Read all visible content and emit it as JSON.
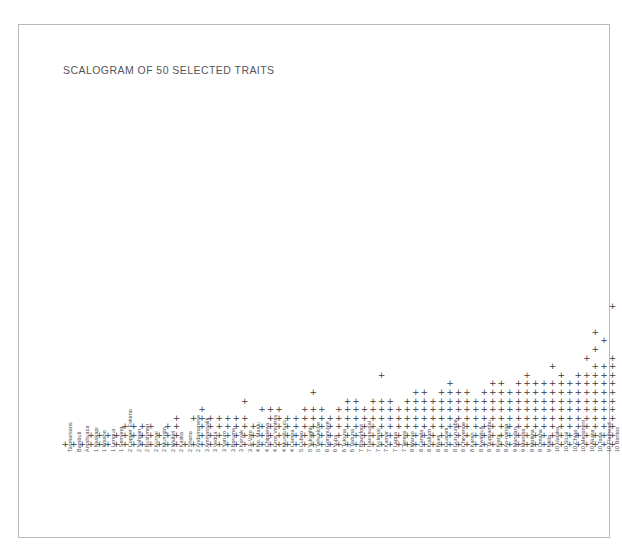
{
  "figure": {
    "title": "SCALOGRAM OF 50 SELECTED TRAITS",
    "mark_glyph": "+",
    "mark_color": "#3b3b3f",
    "frame_color": "#b9b9b9",
    "background": "#ffffff"
  },
  "chart_data": {
    "type": "scatter",
    "title": "SCALOGRAM OF 50 SELECTED TRAITS",
    "xlabel": "",
    "ylabel": "",
    "grid": false,
    "legend": "none",
    "marker": "+",
    "n_rows": 50,
    "n_columns": 89,
    "categories": [
      "Tasmanians",
      "Bambuti",
      "Amahuaca",
      "1 Naskapi",
      "1 Washo",
      "1 Lengua",
      "1 Semang",
      "2 Copper Eskimo",
      "2 Yahgan",
      "2 Bushmen",
      "2 Kurnai",
      "2 Murngin",
      "2 Walbiri",
      "2 Kaska",
      "2 Shona",
      "2 Andamanese",
      "3 Arunta-Ruwala",
      "3 Vedda",
      "3 Yaruro",
      "3 Boruma",
      "3 Koryak",
      "3 Ji-Vato",
      "4 No. Maidu",
      "4 Chippewa",
      "4 Gros Ventres",
      "4 Mundurucu",
      "4 Campa",
      "5 Cubeo",
      "5 Yukaghir",
      "5 Tehuelche",
      "6 Goranuine",
      "6 Yupa",
      "6 Tukuna",
      "6 Tiatuna",
      "7 Blackfoot",
      "7 Havasupai",
      "7 Kutenai",
      "7 Kamar",
      "7 Lappa",
      "7 Tereno",
      "8 Warao",
      "8 Canela",
      "8 Kiallam",
      "8 Nuer",
      "8 Guarani",
      "8 Gururumba",
      "8 Cheyenne",
      "8 Karen",
      "8 Kwakiutl",
      "9 Tiupnambu",
      "9 Kiara",
      "9 Ao-nanga",
      "9 Mandan",
      "9 Marobo",
      "9 Motima",
      "9 Omaha",
      "9 Nkila",
      "10 Halaka",
      "10 Siuai",
      "10 Chiga",
      "10 Menomini",
      "10 Numa",
      "10 Toda",
      "10 Flathead",
      "10 Bontoc",
      "11 Kapan"
    ],
    "points": [
      [
        0,
        0
      ],
      [
        1,
        0
      ],
      [
        2,
        0
      ],
      [
        3,
        0
      ],
      [
        3,
        1
      ],
      [
        4,
        0
      ],
      [
        4,
        1
      ],
      [
        5,
        0
      ],
      [
        5,
        1
      ],
      [
        6,
        0
      ],
      [
        6,
        1
      ],
      [
        7,
        0
      ],
      [
        7,
        1
      ],
      [
        7,
        2
      ],
      [
        8,
        0
      ],
      [
        8,
        1
      ],
      [
        8,
        2
      ],
      [
        9,
        0
      ],
      [
        9,
        1
      ],
      [
        9,
        2
      ],
      [
        10,
        0
      ],
      [
        10,
        1
      ],
      [
        10,
        2
      ],
      [
        11,
        0
      ],
      [
        11,
        1
      ],
      [
        12,
        0
      ],
      [
        12,
        1
      ],
      [
        12,
        2
      ],
      [
        13,
        0
      ],
      [
        13,
        1
      ],
      [
        13,
        2
      ],
      [
        13,
        3
      ],
      [
        14,
        0
      ],
      [
        15,
        0
      ],
      [
        15,
        3
      ],
      [
        16,
        0
      ],
      [
        16,
        1
      ],
      [
        16,
        2
      ],
      [
        16,
        3
      ],
      [
        16,
        4
      ],
      [
        17,
        0
      ],
      [
        17,
        1
      ],
      [
        17,
        2
      ],
      [
        17,
        3
      ],
      [
        18,
        0
      ],
      [
        18,
        1
      ],
      [
        18,
        2
      ],
      [
        18,
        3
      ],
      [
        19,
        0
      ],
      [
        19,
        1
      ],
      [
        19,
        2
      ],
      [
        19,
        3
      ],
      [
        20,
        0
      ],
      [
        20,
        1
      ],
      [
        20,
        2
      ],
      [
        20,
        3
      ],
      [
        21,
        0
      ],
      [
        21,
        1
      ],
      [
        21,
        2
      ],
      [
        21,
        3
      ],
      [
        21,
        5
      ],
      [
        22,
        0
      ],
      [
        22,
        1
      ],
      [
        22,
        2
      ],
      [
        23,
        0
      ],
      [
        23,
        1
      ],
      [
        23,
        2
      ],
      [
        23,
        4
      ],
      [
        24,
        0
      ],
      [
        24,
        1
      ],
      [
        24,
        2
      ],
      [
        24,
        3
      ],
      [
        24,
        4
      ],
      [
        25,
        0
      ],
      [
        25,
        1
      ],
      [
        25,
        2
      ],
      [
        25,
        3
      ],
      [
        25,
        4
      ],
      [
        26,
        0
      ],
      [
        26,
        1
      ],
      [
        26,
        2
      ],
      [
        26,
        3
      ],
      [
        27,
        0
      ],
      [
        27,
        1
      ],
      [
        27,
        2
      ],
      [
        27,
        3
      ],
      [
        28,
        0
      ],
      [
        28,
        1
      ],
      [
        28,
        2
      ],
      [
        28,
        3
      ],
      [
        28,
        4
      ],
      [
        29,
        0
      ],
      [
        29,
        1
      ],
      [
        29,
        2
      ],
      [
        29,
        3
      ],
      [
        29,
        4
      ],
      [
        29,
        6
      ],
      [
        30,
        0
      ],
      [
        30,
        1
      ],
      [
        30,
        2
      ],
      [
        30,
        3
      ],
      [
        30,
        4
      ],
      [
        31,
        0
      ],
      [
        31,
        1
      ],
      [
        31,
        2
      ],
      [
        31,
        3
      ],
      [
        32,
        0
      ],
      [
        32,
        1
      ],
      [
        32,
        2
      ],
      [
        32,
        3
      ],
      [
        32,
        4
      ],
      [
        33,
        0
      ],
      [
        33,
        1
      ],
      [
        33,
        2
      ],
      [
        33,
        3
      ],
      [
        33,
        4
      ],
      [
        33,
        5
      ],
      [
        34,
        0
      ],
      [
        34,
        1
      ],
      [
        34,
        2
      ],
      [
        34,
        3
      ],
      [
        34,
        4
      ],
      [
        34,
        5
      ],
      [
        35,
        0
      ],
      [
        35,
        1
      ],
      [
        35,
        2
      ],
      [
        35,
        3
      ],
      [
        35,
        4
      ],
      [
        36,
        0
      ],
      [
        36,
        1
      ],
      [
        36,
        2
      ],
      [
        36,
        3
      ],
      [
        36,
        4
      ],
      [
        36,
        5
      ],
      [
        37,
        0
      ],
      [
        37,
        1
      ],
      [
        37,
        2
      ],
      [
        37,
        3
      ],
      [
        37,
        4
      ],
      [
        37,
        5
      ],
      [
        37,
        8
      ],
      [
        38,
        0
      ],
      [
        38,
        1
      ],
      [
        38,
        2
      ],
      [
        38,
        3
      ],
      [
        38,
        4
      ],
      [
        38,
        5
      ],
      [
        39,
        0
      ],
      [
        39,
        1
      ],
      [
        39,
        2
      ],
      [
        39,
        3
      ],
      [
        39,
        4
      ],
      [
        40,
        0
      ],
      [
        40,
        1
      ],
      [
        40,
        2
      ],
      [
        40,
        3
      ],
      [
        40,
        4
      ],
      [
        40,
        5
      ],
      [
        41,
        0
      ],
      [
        41,
        1
      ],
      [
        41,
        2
      ],
      [
        41,
        3
      ],
      [
        41,
        4
      ],
      [
        41,
        5
      ],
      [
        41,
        6
      ],
      [
        42,
        0
      ],
      [
        42,
        1
      ],
      [
        42,
        2
      ],
      [
        42,
        3
      ],
      [
        42,
        4
      ],
      [
        42,
        5
      ],
      [
        42,
        6
      ],
      [
        43,
        0
      ],
      [
        43,
        1
      ],
      [
        43,
        2
      ],
      [
        43,
        3
      ],
      [
        43,
        4
      ],
      [
        43,
        5
      ],
      [
        44,
        0
      ],
      [
        44,
        1
      ],
      [
        44,
        2
      ],
      [
        44,
        3
      ],
      [
        44,
        4
      ],
      [
        44,
        5
      ],
      [
        44,
        6
      ],
      [
        45,
        0
      ],
      [
        45,
        1
      ],
      [
        45,
        2
      ],
      [
        45,
        3
      ],
      [
        45,
        4
      ],
      [
        45,
        5
      ],
      [
        45,
        6
      ],
      [
        45,
        7
      ],
      [
        46,
        0
      ],
      [
        46,
        1
      ],
      [
        46,
        2
      ],
      [
        46,
        3
      ],
      [
        46,
        4
      ],
      [
        46,
        5
      ],
      [
        46,
        6
      ],
      [
        47,
        0
      ],
      [
        47,
        1
      ],
      [
        47,
        2
      ],
      [
        47,
        3
      ],
      [
        47,
        4
      ],
      [
        47,
        5
      ],
      [
        47,
        6
      ],
      [
        48,
        0
      ],
      [
        48,
        1
      ],
      [
        48,
        2
      ],
      [
        48,
        3
      ],
      [
        48,
        4
      ],
      [
        48,
        5
      ],
      [
        49,
        0
      ],
      [
        49,
        1
      ],
      [
        49,
        2
      ],
      [
        49,
        3
      ],
      [
        49,
        4
      ],
      [
        49,
        5
      ],
      [
        49,
        6
      ],
      [
        50,
        0
      ],
      [
        50,
        1
      ],
      [
        50,
        2
      ],
      [
        50,
        3
      ],
      [
        50,
        4
      ],
      [
        50,
        5
      ],
      [
        50,
        6
      ],
      [
        50,
        7
      ],
      [
        51,
        0
      ],
      [
        51,
        1
      ],
      [
        51,
        2
      ],
      [
        51,
        3
      ],
      [
        51,
        4
      ],
      [
        51,
        5
      ],
      [
        51,
        6
      ],
      [
        51,
        7
      ],
      [
        52,
        0
      ],
      [
        52,
        1
      ],
      [
        52,
        2
      ],
      [
        52,
        3
      ],
      [
        52,
        4
      ],
      [
        52,
        5
      ],
      [
        52,
        6
      ],
      [
        53,
        0
      ],
      [
        53,
        1
      ],
      [
        53,
        2
      ],
      [
        53,
        3
      ],
      [
        53,
        4
      ],
      [
        53,
        5
      ],
      [
        53,
        6
      ],
      [
        53,
        7
      ],
      [
        54,
        0
      ],
      [
        54,
        1
      ],
      [
        54,
        2
      ],
      [
        54,
        3
      ],
      [
        54,
        4
      ],
      [
        54,
        5
      ],
      [
        54,
        6
      ],
      [
        54,
        7
      ],
      [
        54,
        8
      ],
      [
        55,
        0
      ],
      [
        55,
        1
      ],
      [
        55,
        2
      ],
      [
        55,
        3
      ],
      [
        55,
        4
      ],
      [
        55,
        5
      ],
      [
        55,
        6
      ],
      [
        55,
        7
      ],
      [
        56,
        0
      ],
      [
        56,
        1
      ],
      [
        56,
        2
      ],
      [
        56,
        3
      ],
      [
        56,
        4
      ],
      [
        56,
        5
      ],
      [
        56,
        6
      ],
      [
        56,
        7
      ],
      [
        57,
        0
      ],
      [
        57,
        1
      ],
      [
        57,
        2
      ],
      [
        57,
        3
      ],
      [
        57,
        4
      ],
      [
        57,
        5
      ],
      [
        57,
        6
      ],
      [
        57,
        7
      ],
      [
        57,
        9
      ],
      [
        58,
        0
      ],
      [
        58,
        1
      ],
      [
        58,
        2
      ],
      [
        58,
        3
      ],
      [
        58,
        4
      ],
      [
        58,
        5
      ],
      [
        58,
        6
      ],
      [
        58,
        7
      ],
      [
        58,
        8
      ],
      [
        59,
        0
      ],
      [
        59,
        1
      ],
      [
        59,
        2
      ],
      [
        59,
        3
      ],
      [
        59,
        4
      ],
      [
        59,
        5
      ],
      [
        59,
        6
      ],
      [
        59,
        7
      ],
      [
        60,
        0
      ],
      [
        60,
        1
      ],
      [
        60,
        2
      ],
      [
        60,
        3
      ],
      [
        60,
        4
      ],
      [
        60,
        5
      ],
      [
        60,
        6
      ],
      [
        60,
        7
      ],
      [
        60,
        8
      ],
      [
        61,
        0
      ],
      [
        61,
        1
      ],
      [
        61,
        2
      ],
      [
        61,
        3
      ],
      [
        61,
        4
      ],
      [
        61,
        5
      ],
      [
        61,
        6
      ],
      [
        61,
        7
      ],
      [
        61,
        8
      ],
      [
        61,
        10
      ],
      [
        62,
        0
      ],
      [
        62,
        1
      ],
      [
        62,
        2
      ],
      [
        62,
        3
      ],
      [
        62,
        4
      ],
      [
        62,
        5
      ],
      [
        62,
        6
      ],
      [
        62,
        7
      ],
      [
        62,
        8
      ],
      [
        62,
        9
      ],
      [
        62,
        11
      ],
      [
        62,
        13
      ],
      [
        63,
        0
      ],
      [
        63,
        1
      ],
      [
        63,
        2
      ],
      [
        63,
        3
      ],
      [
        63,
        4
      ],
      [
        63,
        5
      ],
      [
        63,
        6
      ],
      [
        63,
        7
      ],
      [
        63,
        8
      ],
      [
        63,
        9
      ],
      [
        63,
        12
      ],
      [
        64,
        0
      ],
      [
        64,
        1
      ],
      [
        64,
        2
      ],
      [
        64,
        3
      ],
      [
        64,
        4
      ],
      [
        64,
        5
      ],
      [
        64,
        6
      ],
      [
        64,
        7
      ],
      [
        64,
        8
      ],
      [
        64,
        9
      ],
      [
        64,
        10
      ],
      [
        64,
        16
      ]
    ]
  },
  "axis": {
    "bottom_labels": [
      "Tasmanians",
      "Bambuti",
      "Amahuaca",
      "1 Naskapi",
      "1 Washo",
      "1 Lengua",
      "1 Semang",
      "2 Copper Eskimo",
      "2 Yahgan",
      "2 Bushmen",
      "2 Kurnai",
      "2 Murngin",
      "2 Walbiri",
      "2 Kaska",
      "2 Shono",
      "2 Andamanese",
      "3 Ammassalik",
      "3 Vedda",
      "3 Yaruro",
      "3 Boruma",
      "3 Koryak",
      "3 Ji-Vato",
      "4 No. Maidu",
      "4 Chippewa",
      "4 Gros Ventres",
      "4 Mundurucu",
      "4 Campa",
      "5 Cubeo",
      "5 Yukaghir",
      "5 Tehuelche",
      "6 Goranuine",
      "6 Yupa",
      "6 Tukuna",
      "6 Tiatuna",
      "7 Blackfoot",
      "7 Havasupai",
      "7 Kutenai",
      "7 Kamar",
      "7 Lappa",
      "7 Tereno",
      "8 Warao",
      "8 Canela",
      "8 Kiallam",
      "8 Nuer",
      "8 Guarani",
      "8 Gururumba",
      "8 Cheyenne",
      "8 Karen",
      "8 Kwakiutl",
      "9 Tiupnambu",
      "9 Kiara",
      "9 Ao-nanga",
      "9 Mandan",
      "9 Marobo",
      "9 Motima",
      "9 Omaha",
      "9 Nkila",
      "10 Halaka",
      "10 Siuai",
      "10 Chiga",
      "10 Menomini",
      "10 Numa",
      "10 Toda",
      "10 Flathead",
      "10 Bontoc",
      "11 Kapan"
    ]
  }
}
